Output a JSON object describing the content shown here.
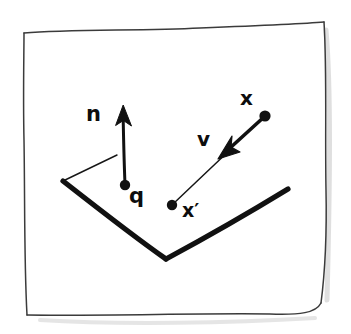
{
  "figure": {
    "kind": "hand-drawn-diagram",
    "background_color": "#ffffff",
    "ink_color": "#111111",
    "frame": {
      "name": "sketch-border",
      "style": "hand-drawn wobbly rectangle",
      "stroke_color": "#3a3a3a",
      "stroke_width": 1.4
    },
    "labels": {
      "normal": "n",
      "surface_point": "q",
      "velocity": "v",
      "position": "x",
      "projected_position": "x′"
    },
    "points": [
      {
        "name": "q",
        "label": "q",
        "x": 125,
        "y": 185
      },
      {
        "name": "x",
        "label": "x",
        "x": 265,
        "y": 116
      },
      {
        "name": "x-prime",
        "label": "x′",
        "x": 172,
        "y": 205
      }
    ],
    "vectors": [
      {
        "name": "normal-vector",
        "label": "n",
        "from": {
          "x": 125,
          "y": 185
        },
        "to": {
          "x": 123,
          "y": 108
        },
        "stroke_width": 3.0,
        "arrowhead": "solid"
      },
      {
        "name": "velocity-vector",
        "label": "v",
        "from": {
          "x": 265,
          "y": 116
        },
        "to": {
          "x": 224,
          "y": 154
        },
        "stroke_width": 3.4,
        "arrowhead": "solid"
      },
      {
        "name": "x-prime-connector",
        "label": "",
        "from": {
          "x": 172,
          "y": 205
        },
        "to": {
          "x": 232,
          "y": 148
        },
        "stroke_width": 1.4,
        "arrowhead": "none"
      }
    ],
    "surface": {
      "name": "v-surface",
      "stroke_width_thick": 5.0,
      "stroke_width_thin": 1.3,
      "left_arm": {
        "from": {
          "x": 63,
          "y": 181
        },
        "to": {
          "x": 166,
          "y": 259
        }
      },
      "right_arm": {
        "from": {
          "x": 166,
          "y": 259
        },
        "to": {
          "x": 288,
          "y": 189
        }
      },
      "depth_edge": {
        "from": {
          "x": 63,
          "y": 181
        },
        "to": {
          "x": 117,
          "y": 155
        }
      }
    }
  }
}
